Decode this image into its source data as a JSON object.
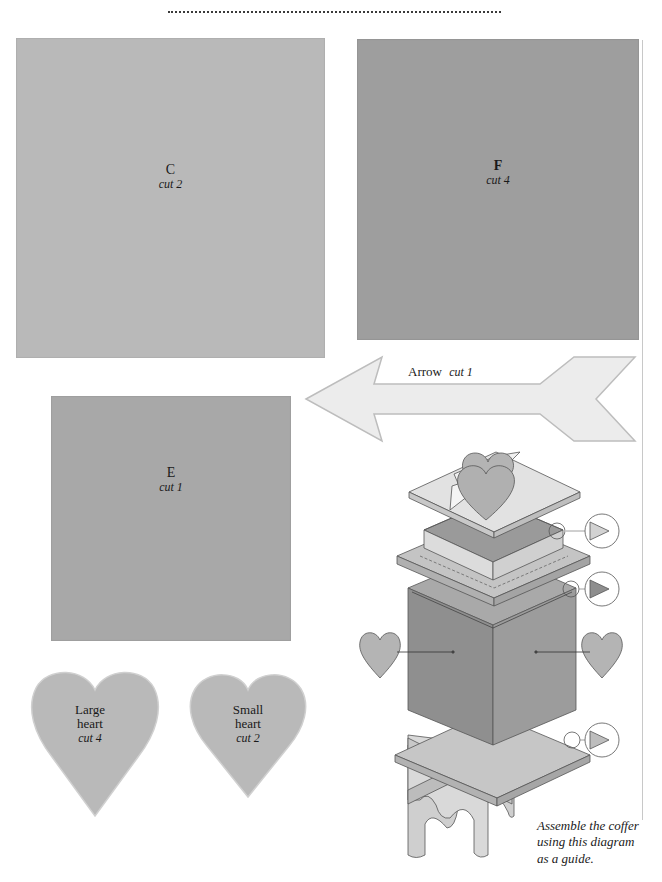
{
  "pieces": {
    "c": {
      "name": "C",
      "cut": "cut 2",
      "color": "#b9b9b9"
    },
    "f": {
      "name": "F",
      "cut": "cut 4",
      "color": "#9e9e9e"
    },
    "e": {
      "name": "E",
      "cut": "cut 1",
      "color": "#a8a8a8"
    },
    "arrow": {
      "name": "Arrow",
      "cut": "cut 1",
      "color": "#ececec"
    },
    "large_heart": {
      "name_line1": "Large",
      "name_line2": "heart",
      "cut": "cut 4",
      "color": "#b9b9b9"
    },
    "small_heart": {
      "name_line1": "Small",
      "name_line2": "heart",
      "cut": "cut 2",
      "color": "#b9b9b9"
    }
  },
  "diagram": {
    "caption_line1": "Assemble the coffer",
    "caption_line2": "using this diagram",
    "caption_line3": "as a guide.",
    "colors": {
      "lid": "#e2e2e2",
      "tray": "#d6d6d6",
      "tray_inner": "#9a9a9a",
      "ledge": "#c4c4c4",
      "box_left": "#8f8f8f",
      "box_right": "#9c9c9c",
      "base_plate": "#c6c6c6",
      "stand": "#d4d4d4",
      "heart": "#b4b4b4",
      "outline": "#555555"
    }
  }
}
